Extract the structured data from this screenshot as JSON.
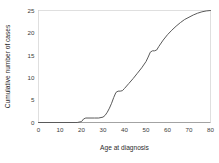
{
  "chart_data": {
    "type": "line",
    "title": "",
    "subtitle": "",
    "xlabel": "Age at diagnosis",
    "ylabel": "Cumulative number of cases",
    "xlim": [
      0,
      80
    ],
    "ylim": [
      0,
      25
    ],
    "xticks": [
      0,
      10,
      20,
      30,
      40,
      50,
      60,
      70,
      80
    ],
    "yticks": [
      0,
      5,
      10,
      15,
      20,
      25
    ],
    "xtick_labels": [
      "0",
      "10",
      "20",
      "30",
      "40",
      "50",
      "60",
      "70",
      "80"
    ],
    "ytick_labels": [
      "0",
      "5",
      "10",
      "15",
      "20",
      "25"
    ],
    "grid": false,
    "legend": false,
    "legend_position": "none",
    "line_color": "#5a5a5a",
    "background_color": "#ffffff",
    "frame_color": "#d2d2d2",
    "annotations": [],
    "series": [
      {
        "name": "Cumulative number of cases",
        "x": [
          0,
          10,
          17,
          18,
          20,
          21,
          22,
          26,
          28,
          30,
          31,
          32,
          33,
          34,
          35,
          36,
          37,
          38,
          39,
          40,
          42,
          44,
          46,
          48,
          50,
          51,
          52,
          53,
          54,
          55,
          56,
          58,
          60,
          62,
          64,
          66,
          68,
          70,
          72,
          74,
          76,
          78,
          80
        ],
        "y": [
          0,
          0,
          0,
          0,
          0.2,
          0.8,
          1,
          1,
          1,
          1.2,
          1.6,
          2.3,
          3.2,
          4.3,
          5.6,
          6.7,
          7,
          7,
          7.1,
          7.6,
          8.7,
          9.8,
          11.0,
          12.2,
          13.6,
          14.6,
          15.7,
          16,
          16,
          16.2,
          17.0,
          18.4,
          19.6,
          20.6,
          21.5,
          22.3,
          23.0,
          23.5,
          24.0,
          24.4,
          24.7,
          24.9,
          25
        ]
      }
    ]
  },
  "axes": {
    "x_title": "Age at diagnosis",
    "y_title": "Cumulative number of cases"
  }
}
